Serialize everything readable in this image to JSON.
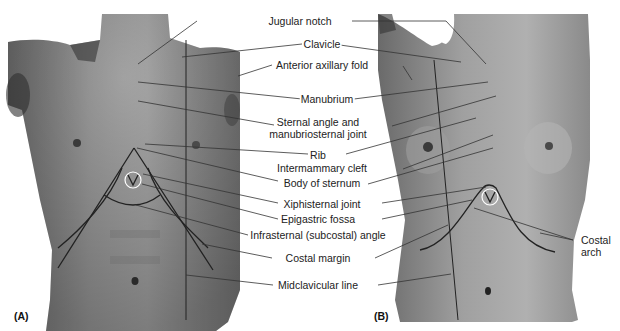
{
  "figure": {
    "panels": [
      {
        "id": "A",
        "tag": "(A)",
        "subject": "male anterior torso"
      },
      {
        "id": "B",
        "tag": "(B)",
        "subject": "female anterior torso"
      }
    ],
    "labels": {
      "jugular_notch": "Jugular notch",
      "clavicle": "Clavicle",
      "anterior_axillary_fold": "Anterior axillary fold",
      "manubrium": "Manubrium",
      "sternal_angle_1": "Sternal angle and",
      "sternal_angle_2": "manubriosternal joint",
      "rib": "Rib",
      "intermammary_cleft": "Intermammary cleft",
      "body_of_sternum": "Body of sternum",
      "xiphisternal_joint": "Xiphisternal joint",
      "epigastric_fossa": "Epigastric fossa",
      "infrasternal_angle": "Infrasternal (subcostal) angle",
      "costal_margin": "Costal margin",
      "midclavicular_line": "Midclavicular line",
      "costal_arch_1": "Costal",
      "costal_arch_2": "arch"
    },
    "colors": {
      "background": "#ffffff",
      "skin_dark": "#5a5a5a",
      "skin_mid": "#8c8c8c",
      "skin_light": "#b4b4b4",
      "leader_line": "#333333",
      "text": "#222222"
    }
  }
}
